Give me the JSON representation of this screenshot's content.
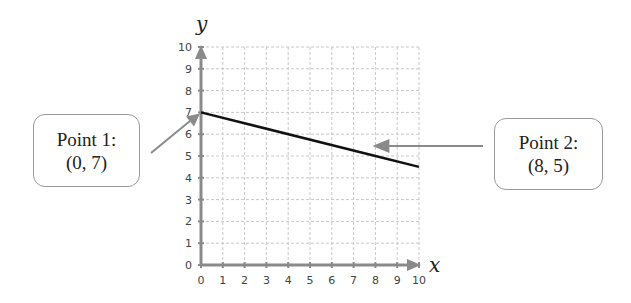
{
  "chart_data": {
    "type": "line",
    "title": "",
    "xlabel": "x",
    "ylabel": "y",
    "xlim": [
      0,
      10
    ],
    "ylim": [
      0,
      10
    ],
    "grid": true,
    "x_ticks": [
      "0",
      "1",
      "2",
      "3",
      "4",
      "5",
      "6",
      "7",
      "8",
      "9",
      "10"
    ],
    "y_ticks": [
      "0",
      "1",
      "2",
      "3",
      "4",
      "5",
      "6",
      "7",
      "8",
      "9",
      "10"
    ],
    "series": [
      {
        "name": "line",
        "x": [
          0,
          8,
          10
        ],
        "y": [
          7,
          5,
          4.5
        ],
        "color": "#111111"
      }
    ],
    "annotations": [
      {
        "label_line1": "Point 1:",
        "label_line2": "(0, 7)",
        "x": 0,
        "y": 7,
        "side": "left"
      },
      {
        "label_line1": "Point 2:",
        "label_line2": "(8, 5)",
        "x": 8,
        "y": 5,
        "side": "right"
      }
    ]
  },
  "colors": {
    "axis": "#8a8a8a",
    "grid": "#c8c8c8",
    "line": "#111111",
    "arrow": "#8a8a8a",
    "tick_text": "#444444"
  }
}
